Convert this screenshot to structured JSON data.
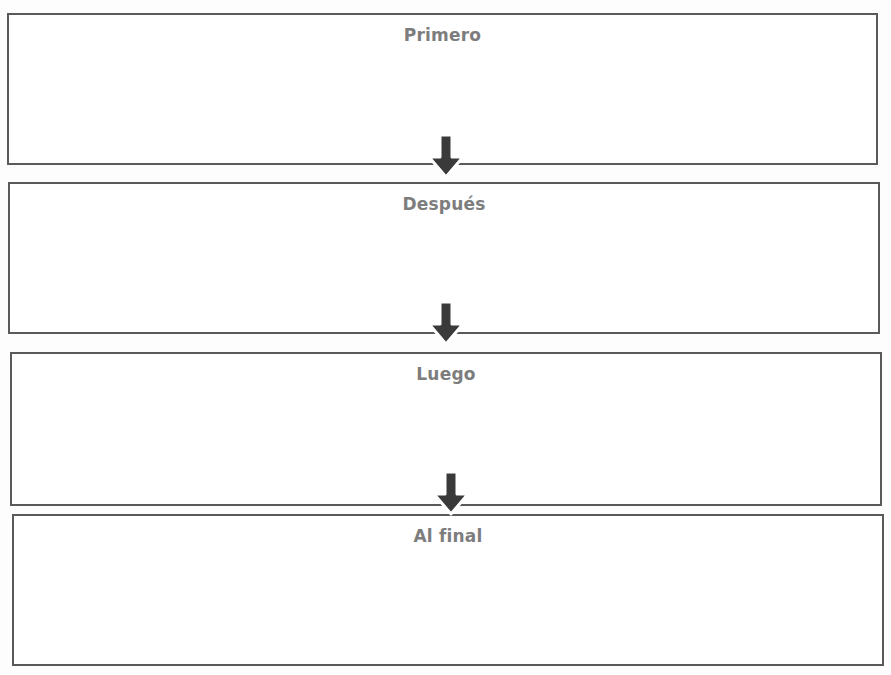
{
  "diagram": {
    "type": "sequence-flowchart",
    "direction": "top-to-bottom",
    "colors": {
      "border": "#5a5a5a",
      "title_text": "#7d7d7d",
      "arrow_fill": "#3a3a3a",
      "arrow_outline": "#ffffff",
      "background": "#ffffff"
    },
    "steps": [
      {
        "label": "Primero",
        "content": ""
      },
      {
        "label": "Después",
        "content": ""
      },
      {
        "label": "Luego",
        "content": ""
      },
      {
        "label": "Al final",
        "content": ""
      }
    ],
    "arrows": [
      {
        "from": "Primero",
        "to": "Después",
        "icon": "down-arrow-icon"
      },
      {
        "from": "Después",
        "to": "Luego",
        "icon": "down-arrow-icon"
      },
      {
        "from": "Luego",
        "to": "Al final",
        "icon": "down-arrow-icon"
      }
    ]
  }
}
